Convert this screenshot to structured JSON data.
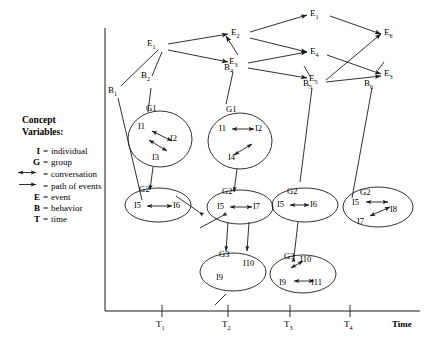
{
  "legend": {
    "title_line1": "Concept",
    "title_line2": "Variables:",
    "rows": [
      {
        "symbol": "I",
        "eq": "=",
        "text": "individual",
        "glyph": "none"
      },
      {
        "symbol": "G",
        "eq": "=",
        "text": "group",
        "glyph": "none"
      },
      {
        "symbol": "",
        "eq": "=",
        "text": "conversation",
        "glyph": "double-arrow-icon"
      },
      {
        "symbol": "",
        "eq": "=",
        "text": "path of events",
        "glyph": "single-arrow-icon"
      },
      {
        "symbol": "E",
        "eq": "=",
        "text": "event",
        "glyph": "none"
      },
      {
        "symbol": "B",
        "eq": "=",
        "text": "behavior",
        "glyph": "none"
      },
      {
        "symbol": "T",
        "eq": "=",
        "text": "time",
        "glyph": "none"
      }
    ]
  },
  "axis": {
    "x_name": "Time",
    "ticks": [
      {
        "base": "T",
        "sub": "1"
      },
      {
        "base": "T",
        "sub": "2"
      },
      {
        "base": "T",
        "sub": "3"
      },
      {
        "base": "T",
        "sub": "4"
      }
    ]
  },
  "events": [
    {
      "id": "e1",
      "base": "E",
      "sub": "1"
    },
    {
      "id": "e2",
      "base": "E",
      "sub": "2"
    },
    {
      "id": "e3",
      "base": "E",
      "sub": "3"
    },
    {
      "id": "e1b",
      "base": "E",
      "sub": "1"
    },
    {
      "id": "e4",
      "base": "E",
      "sub": "4"
    },
    {
      "id": "e5",
      "base": "E",
      "sub": "5"
    },
    {
      "id": "e6",
      "base": "E",
      "sub": "6"
    },
    {
      "id": "e3b",
      "base": "E",
      "sub": "3"
    }
  ],
  "behaviors": [
    {
      "id": "b1",
      "base": "B",
      "sub": "1"
    },
    {
      "id": "b2",
      "base": "B",
      "sub": "2"
    },
    {
      "id": "b4",
      "base": "B",
      "sub": "4"
    },
    {
      "id": "b5",
      "base": "B",
      "sub": "5"
    },
    {
      "id": "b6",
      "base": "B",
      "sub": "6"
    }
  ],
  "groups": [
    {
      "id": "g1c1",
      "label": "G1",
      "members": [
        "I1",
        "I2",
        "I3"
      ]
    },
    {
      "id": "g2c1",
      "label": "G2",
      "members": [
        "I5",
        "I6"
      ]
    },
    {
      "id": "g1c2",
      "label": "G1",
      "members": [
        "I1",
        "I2",
        "I4"
      ]
    },
    {
      "id": "g2c2",
      "label": "G2",
      "members": [
        "I5",
        "I7"
      ]
    },
    {
      "id": "g3c2",
      "label": "G3",
      "members": [
        "I9",
        "I10"
      ]
    },
    {
      "id": "g2c3",
      "label": "G2",
      "members": [
        "I5",
        "I6"
      ]
    },
    {
      "id": "g3c3",
      "label": "G3",
      "members": [
        "I10",
        "I9",
        "I11"
      ]
    },
    {
      "id": "g2c4",
      "label": "G2",
      "members": [
        "I5",
        "I8",
        "I7"
      ]
    }
  ],
  "individuals": {
    "i1a": "I1",
    "i2a": "I2",
    "i3a": "I3",
    "i5a": "I5",
    "i6a": "I6",
    "i1b": "I1",
    "i2b": "I2",
    "i4b": "I4",
    "i5b": "I5",
    "i7b": "I7",
    "i9b": "I9",
    "i10b": "I10",
    "i5c": "I5",
    "i6c": "I6",
    "i10c": "I10",
    "i9c": "I9",
    "i11c": "I11",
    "i5d": "I5",
    "i8d": "I8",
    "i7d": "I7"
  },
  "colors": {
    "stroke": "#1a1a1a",
    "background": "#ffffff"
  }
}
